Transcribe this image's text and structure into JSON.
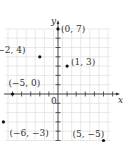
{
  "figure": {
    "type": "coordinate-plane",
    "axes": {
      "x_label": "x",
      "y_label": "y",
      "origin_label": "0"
    },
    "grid": {
      "xmin": -6,
      "xmax": 6,
      "ymin": -5,
      "ymax": 7
    },
    "colors": {
      "grid": "#d9d9d9",
      "axis": "#333333",
      "point": "#111111"
    },
    "points": [
      {
        "x": 0,
        "y": 7,
        "label": "(0, 7)"
      },
      {
        "x": -2,
        "y": 4,
        "label": "(−2, 4)"
      },
      {
        "x": 1,
        "y": 3,
        "label": "(1, 3)"
      },
      {
        "x": -5,
        "y": 0,
        "label": "(−5, 0)"
      },
      {
        "x": -6,
        "y": -3,
        "label": "(−6, −3)"
      },
      {
        "x": 5,
        "y": -5,
        "label": "(5, −5)"
      }
    ]
  }
}
